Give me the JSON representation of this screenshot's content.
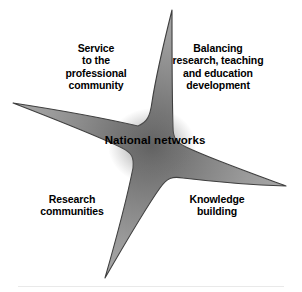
{
  "figure": {
    "background_color": "#ffffff"
  },
  "center": {
    "label": "National networks",
    "text_color": "#000000"
  },
  "labels": [
    {
      "id": "service",
      "text": "Service\nto the\nprofessional\ncommunity",
      "quadrant": "top-left"
    },
    {
      "id": "balancing",
      "text": "Balancing\nresearch, teaching\nand education\ndevelopment",
      "quadrant": "top-right"
    },
    {
      "id": "research",
      "text": "Research\ncommunities",
      "quadrant": "bottom-left"
    },
    {
      "id": "knowledge",
      "text": "Knowledge\nbuilding",
      "quadrant": "bottom-right"
    }
  ],
  "star": {
    "arm_count": 4,
    "arms": [
      {
        "id": "arm-top",
        "direction": "up",
        "tip_x": 172,
        "tip_y": 10
      },
      {
        "id": "arm-left",
        "direction": "left",
        "tip_x": 13,
        "tip_y": 103
      },
      {
        "id": "arm-right",
        "direction": "right",
        "tip_x": 286,
        "tip_y": 186
      },
      {
        "id": "arm-bottom",
        "direction": "down",
        "tip_x": 105,
        "tip_y": 278
      }
    ],
    "fill_center_color": "#6f6f6f",
    "fill_mid_color": "#8f8f8f",
    "fill_edge_color": "#a6a6a6",
    "outline_color": "#3c3c3c"
  }
}
